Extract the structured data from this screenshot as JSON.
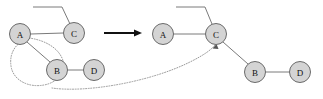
{
  "figure": {
    "name": "graph-transformation-diagram",
    "background_color": "#ffffff",
    "node_fill": "#d4d4d4",
    "node_stroke": "#6a6a6a",
    "edge_color": "#7a7a7a",
    "dotted_color": "#9a9a9a",
    "arrow_color": "#111111",
    "node_radius": 10.5
  },
  "left_graph": {
    "name": "before-graph",
    "nodes": [
      {
        "id": "A",
        "label": "A",
        "cx": 20,
        "cy": 34
      },
      {
        "id": "C",
        "label": "C",
        "cx": 74,
        "cy": 33
      },
      {
        "id": "B",
        "label": "B",
        "cx": 57,
        "cy": 70
      },
      {
        "id": "D",
        "label": "D",
        "cx": 94,
        "cy": 70
      }
    ],
    "edges": [
      {
        "from": "A",
        "to": "C"
      },
      {
        "from": "A",
        "to": "B"
      },
      {
        "from": "B",
        "to": "D"
      }
    ],
    "stub": {
      "name": "top-stub-edge",
      "points": "33,7 62,7 70,24"
    },
    "selection_lasso": {
      "name": "selection-lasso",
      "contains": [
        "A",
        "B"
      ],
      "path": "M29,38 C44,40 57,47 62,58 C67,69 60,82 44,85 C28,88 13,80 11,66 C9,53 16,42 29,38"
    }
  },
  "right_graph": {
    "name": "after-graph",
    "nodes": [
      {
        "id": "A",
        "label": "A",
        "cx": 163,
        "cy": 34
      },
      {
        "id": "C",
        "label": "C",
        "cx": 216,
        "cy": 34
      },
      {
        "id": "B",
        "label": "B",
        "cx": 255,
        "cy": 72
      },
      {
        "id": "D",
        "label": "D",
        "cx": 300,
        "cy": 72
      }
    ],
    "edges": [
      {
        "from": "A",
        "to": "C"
      },
      {
        "from": "C",
        "to": "B"
      },
      {
        "from": "B",
        "to": "D"
      }
    ],
    "stub": {
      "name": "top-stub-edge",
      "points": "176,7 205,7 212,24"
    }
  },
  "transform_arrow": {
    "name": "transformation-arrow",
    "x1": 104,
    "y1": 33,
    "x2": 141,
    "y2": 33,
    "direction": "right"
  },
  "transfer_curve": {
    "name": "merge-transfer-curve",
    "path": "M52,88 C86,93 150,82 190,62 C204,55 211,50 215,45",
    "arrow_target": {
      "x": 216,
      "y": 44
    },
    "style": "dotted-with-arrowhead"
  },
  "labels": {
    "node_a": "A",
    "node_b": "B",
    "node_c": "C",
    "node_d": "D"
  }
}
